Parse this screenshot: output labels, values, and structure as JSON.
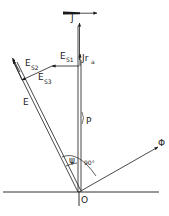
{
  "diagram": {
    "type": "phasor-diagram",
    "colors": {
      "stroke": "#1a1a1a",
      "background": "#ffffff"
    },
    "labels": {
      "J": "J",
      "E_S1_main": "E",
      "E_S1_sub": "S1",
      "E_S2_main": "E",
      "E_S2_sub": "S2",
      "E_S3_main": "E",
      "E_S3_sub": "S3",
      "Jra_main": "Jr",
      "Jra_sub": "a",
      "E": "E",
      "P": "P",
      "psi": "ψ",
      "angle90": "90°",
      "phi": "Φ",
      "origin": "O"
    },
    "vectors": [
      {
        "name": "J",
        "from": "O",
        "direction": "vertical-up"
      },
      {
        "name": "E",
        "from": "O",
        "direction": "upper-left"
      },
      {
        "name": "Phi",
        "from": "O",
        "direction": "right-up",
        "angle_to_J": "90°"
      },
      {
        "name": "E_S1",
        "orientation": "horizontal"
      },
      {
        "name": "E_S2"
      },
      {
        "name": "E_S3"
      }
    ]
  }
}
